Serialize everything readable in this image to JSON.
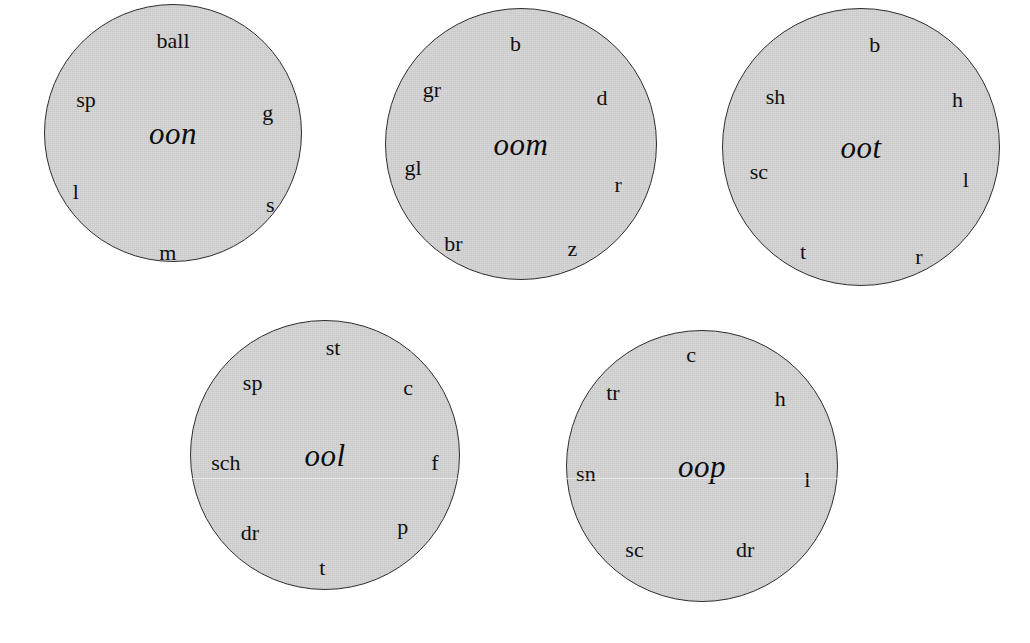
{
  "figure": {
    "background_color": "#ffffff",
    "circle_fill_color": "#c9c9c9",
    "circle_border_color": "#2e2e2e",
    "text_color": "#101010",
    "circle_count": 5
  },
  "circles": [
    {
      "id": "circle-oon",
      "rime": "oon",
      "left": 44,
      "top": 4,
      "size": 258,
      "onsets": [
        {
          "label": "ball",
          "x": 50,
          "y": 14
        },
        {
          "label": "sp",
          "x": 16,
          "y": 37
        },
        {
          "label": "g",
          "x": 87,
          "y": 42
        },
        {
          "label": "l",
          "x": 12,
          "y": 73
        },
        {
          "label": "s",
          "x": 88,
          "y": 78
        },
        {
          "label": "m",
          "x": 48,
          "y": 97
        }
      ]
    },
    {
      "id": "circle-oom",
      "rime": "oom",
      "left": 385,
      "top": 8,
      "size": 272,
      "onsets": [
        {
          "label": "b",
          "x": 48,
          "y": 13
        },
        {
          "label": "gr",
          "x": 17,
          "y": 30
        },
        {
          "label": "d",
          "x": 80,
          "y": 33
        },
        {
          "label": "gl",
          "x": 10,
          "y": 59
        },
        {
          "label": "r",
          "x": 86,
          "y": 65
        },
        {
          "label": "br",
          "x": 25,
          "y": 87
        },
        {
          "label": "z",
          "x": 69,
          "y": 89
        }
      ]
    },
    {
      "id": "circle-oot",
      "rime": "oot",
      "left": 722,
      "top": 8,
      "size": 278,
      "onsets": [
        {
          "label": "b",
          "x": 55,
          "y": 13
        },
        {
          "label": "sh",
          "x": 19,
          "y": 32
        },
        {
          "label": "h",
          "x": 85,
          "y": 33
        },
        {
          "label": "sc",
          "x": 13,
          "y": 59
        },
        {
          "label": "l",
          "x": 88,
          "y": 62
        },
        {
          "label": "t",
          "x": 29,
          "y": 88
        },
        {
          "label": "r",
          "x": 71,
          "y": 90
        }
      ]
    },
    {
      "id": "circle-ool",
      "rime": "ool",
      "left": 190,
      "top": 320,
      "size": 270,
      "onsets": [
        {
          "label": "st",
          "x": 53,
          "y": 10
        },
        {
          "label": "sp",
          "x": 23,
          "y": 23
        },
        {
          "label": "c",
          "x": 81,
          "y": 25
        },
        {
          "label": "sch",
          "x": 13,
          "y": 53
        },
        {
          "label": "f",
          "x": 91,
          "y": 53
        },
        {
          "label": "dr",
          "x": 22,
          "y": 79
        },
        {
          "label": "p",
          "x": 79,
          "y": 77
        },
        {
          "label": "t",
          "x": 49,
          "y": 92
        }
      ]
    },
    {
      "id": "circle-oop",
      "rime": "oop",
      "left": 566,
      "top": 330,
      "size": 272,
      "onsets": [
        {
          "label": "c",
          "x": 46,
          "y": 9
        },
        {
          "label": "tr",
          "x": 17,
          "y": 23
        },
        {
          "label": "h",
          "x": 79,
          "y": 25
        },
        {
          "label": "sn",
          "x": 7,
          "y": 53
        },
        {
          "label": "l",
          "x": 89,
          "y": 55
        },
        {
          "label": "sc",
          "x": 25,
          "y": 81
        },
        {
          "label": "dr",
          "x": 66,
          "y": 81
        }
      ]
    }
  ],
  "artifacts": {
    "scanline_top": 478,
    "scanline_present": true
  }
}
